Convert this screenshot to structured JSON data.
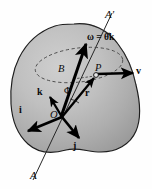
{
  "figure": {
    "background_color": "#fefefe",
    "body_fill_color": "#b3b3b3",
    "body_outline_color": "#1a1a1a",
    "vector_color": "#000000",
    "axis_line_color": "#2b2b2b",
    "dashed_path_color": "#3a3a3a"
  },
  "labels": {
    "axis_top": "A'",
    "axis_bottom": "A",
    "angular_velocity": "ω = θ̇k",
    "omega_symbol": "ω",
    "equals_sign": "=",
    "theta_dot_k": "θ̇k",
    "point_b": "B",
    "point_p": "P",
    "origin_o": "O",
    "angle_phi": "Φ",
    "unit_vector_i": "i",
    "unit_vector_j": "j",
    "unit_vector_k": "k",
    "position_vector_r": "r",
    "velocity_vector_v": "v"
  },
  "elements": {
    "rigid_body_name": "shaded-rigid-body",
    "rotation_axis_name": "rotation-axis-line",
    "circular_path_name": "dashed-circular-path",
    "omega_arrow_name": "angular-velocity-arrow",
    "r_arrow_name": "position-vector-arrow",
    "v_arrow_name": "velocity-vector-arrow",
    "i_arrow_name": "unit-vector-i-arrow",
    "j_arrow_name": "unit-vector-j-arrow",
    "k_arrow_name": "unit-vector-k-arrow",
    "phi_arc_name": "angle-phi-arc",
    "b_to_p_name": "radius-segment-b-to-p"
  },
  "geometry": {
    "origin_point": [
      62,
      117
    ],
    "point_b": [
      72,
      78
    ],
    "point_p": [
      97,
      75
    ],
    "axis_top_point": [
      110,
      14
    ],
    "axis_bottom_point": [
      34,
      178
    ]
  }
}
